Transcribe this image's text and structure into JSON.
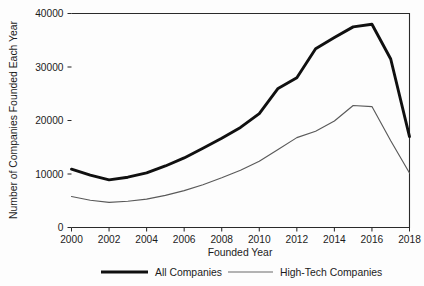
{
  "chart_data": {
    "type": "line",
    "title": "",
    "xlabel": "Founded Year",
    "ylabel": "Number of Companies Founded Each Year",
    "x": [
      2000,
      2001,
      2002,
      2003,
      2004,
      2005,
      2006,
      2007,
      2008,
      2009,
      2010,
      2011,
      2012,
      2013,
      2014,
      2015,
      2016,
      2017,
      2018
    ],
    "xlim": [
      2000,
      2018
    ],
    "ylim": [
      0,
      40000
    ],
    "xticks": [
      2000,
      2002,
      2004,
      2006,
      2008,
      2010,
      2012,
      2014,
      2016,
      2018
    ],
    "xtick_labels": [
      "2000",
      "2002",
      "2004",
      "2006",
      "2008",
      "2010",
      "2012",
      "2014",
      "2016",
      "2018"
    ],
    "yticks": [
      0,
      10000,
      20000,
      30000,
      40000
    ],
    "ytick_labels": [
      "0",
      "10000",
      "20000",
      "30000",
      "40000"
    ],
    "grid": false,
    "legend_position": "bottom",
    "series": [
      {
        "name": "All Companies",
        "style": "thick-solid",
        "color": "#101010",
        "values": [
          10900,
          9800,
          8900,
          9400,
          10200,
          11500,
          13000,
          14800,
          16700,
          18700,
          21300,
          26000,
          28000,
          33400,
          35500,
          37500,
          38000,
          31500,
          17000
        ]
      },
      {
        "name": "High-Tech Companies",
        "style": "thin-solid",
        "color": "#6a6a6a",
        "values": [
          5800,
          5100,
          4700,
          4900,
          5300,
          6000,
          6900,
          8000,
          9300,
          10700,
          12400,
          14600,
          16800,
          18000,
          19900,
          22800,
          22600,
          16200,
          10200
        ]
      }
    ]
  },
  "legend": {
    "entries": [
      {
        "label": "All Companies",
        "marker": "thick-line"
      },
      {
        "label": "High-Tech Companies",
        "marker": "thin-line"
      }
    ]
  },
  "axes": {
    "x_title": "Founded Year",
    "y_title": "Number of Companies Founded Each Year"
  }
}
